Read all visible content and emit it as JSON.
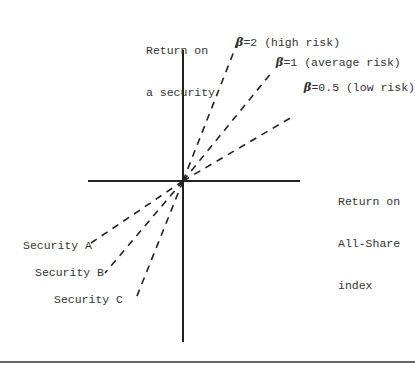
{
  "diagram": {
    "y_axis_label": [
      "Return on",
      "a security"
    ],
    "x_axis_label": [
      "Return on",
      "All-Share",
      "index"
    ],
    "lines": [
      {
        "symbol": "β",
        "label": "=2 (high risk)",
        "beta": 2
      },
      {
        "symbol": "β",
        "label": "=1 (average risk)",
        "beta": 1
      },
      {
        "symbol": "β",
        "label": "=0.5 (low risk)",
        "beta": 0.5
      }
    ],
    "securities": [
      "Security A",
      "Security B",
      "Security C"
    ]
  }
}
